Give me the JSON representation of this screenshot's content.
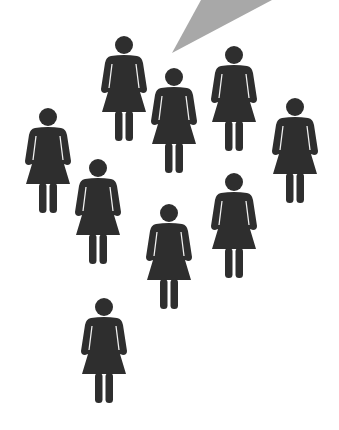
{
  "diagram": {
    "colors": {
      "background": "#ffffff",
      "figure": "#2e2e2e",
      "arm_gap": "#f2f2f2",
      "pointer": "#a8a8a8"
    },
    "pointer": {
      "points": "201,0 272,0 172,53"
    },
    "figures": [
      {
        "id": 1,
        "icon": "woman-pictogram-icon",
        "x": 101,
        "y": 36
      },
      {
        "id": 2,
        "icon": "woman-pictogram-icon",
        "x": 151,
        "y": 68
      },
      {
        "id": 3,
        "icon": "woman-pictogram-icon",
        "x": 211,
        "y": 46
      },
      {
        "id": 4,
        "icon": "woman-pictogram-icon",
        "x": 25,
        "y": 108
      },
      {
        "id": 5,
        "icon": "woman-pictogram-icon",
        "x": 272,
        "y": 98
      },
      {
        "id": 6,
        "icon": "woman-pictogram-icon",
        "x": 75,
        "y": 159
      },
      {
        "id": 7,
        "icon": "woman-pictogram-icon",
        "x": 211,
        "y": 173
      },
      {
        "id": 8,
        "icon": "woman-pictogram-icon",
        "x": 146,
        "y": 204
      },
      {
        "id": 9,
        "icon": "woman-pictogram-icon",
        "x": 81,
        "y": 298
      }
    ]
  }
}
